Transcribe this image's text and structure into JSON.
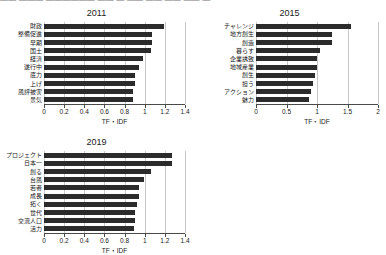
{
  "top_strip": {
    "text": "——  ———   ——————   —— — ——  —— —— —— —"
  },
  "colors": {
    "bar": "#2b2b2b",
    "grid": "#c8c8c8",
    "axis": "#4a4a4a",
    "background": "#ffffff"
  },
  "chart_data": [
    {
      "type": "bar",
      "title": "2011",
      "orientation": "horizontal",
      "xlabel": "TF・IDF",
      "ylabel": "",
      "xlim": [
        0,
        1.4
      ],
      "xticks": [
        0,
        0.2,
        0.4,
        0.6,
        0.8,
        1,
        1.2,
        1.4
      ],
      "xticklabels": [
        "0",
        "0.2",
        "0.4",
        "0.6",
        "0.8",
        "1",
        "1.2",
        "1.4"
      ],
      "grid": true,
      "legend": "none",
      "categories": [
        "財政",
        "整備促進",
        "早期",
        "国土",
        "経済",
        "遂行中",
        "底力",
        "上げ",
        "風評被害",
        "景気"
      ],
      "values": [
        1.19,
        1.07,
        1.07,
        1.06,
        0.98,
        0.94,
        0.9,
        0.9,
        0.88,
        0.88
      ]
    },
    {
      "type": "bar",
      "title": "2015",
      "orientation": "horizontal",
      "xlabel": "TF・IDF",
      "ylabel": "",
      "xlim": [
        0,
        2.0
      ],
      "xticks": [
        0,
        0.5,
        1,
        1.5,
        2
      ],
      "xticklabels": [
        "0",
        "0.5",
        "1",
        "1.5",
        "2"
      ],
      "grid": true,
      "legend": "none",
      "categories": [
        "チャレンジ",
        "地方創生",
        "創造",
        "暮らす",
        "企業誘致",
        "地域産業",
        "創生",
        "担う",
        "アクション",
        "魅力"
      ],
      "values": [
        1.56,
        1.25,
        1.25,
        1.05,
        1.0,
        1.0,
        0.97,
        0.93,
        0.9,
        0.87
      ]
    },
    {
      "type": "bar",
      "title": "2019",
      "orientation": "horizontal",
      "xlabel": "TF・IDF",
      "ylabel": "",
      "xlim": [
        0,
        1.4
      ],
      "xticks": [
        0,
        0.2,
        0.4,
        0.6,
        0.8,
        1,
        1.2,
        1.4
      ],
      "xticklabels": [
        "0",
        "0.2",
        "0.4",
        "0.6",
        "0.8",
        "1",
        "1.2",
        "1.4"
      ],
      "grid": true,
      "legend": "none",
      "categories": [
        "プロジェクト",
        "日本一",
        "創る",
        "台風",
        "若者",
        "成長",
        "拓く",
        "世代",
        "交流人口",
        "活力"
      ],
      "values": [
        1.27,
        1.27,
        1.06,
        0.99,
        0.94,
        0.94,
        0.92,
        0.9,
        0.9,
        0.89
      ]
    }
  ]
}
